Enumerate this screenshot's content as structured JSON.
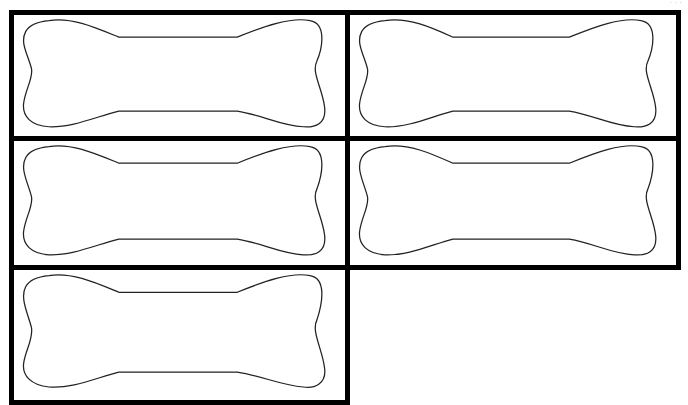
{
  "page": {
    "header_text": "· · ·",
    "cells": [
      {
        "id": 1,
        "shape": "bone-outline",
        "label": ""
      },
      {
        "id": 2,
        "shape": "bone-outline",
        "label": ""
      },
      {
        "id": 3,
        "shape": "bone-outline",
        "label": ""
      },
      {
        "id": 4,
        "shape": "bone-outline",
        "label": ""
      },
      {
        "id": 5,
        "shape": "bone-outline",
        "label": ""
      }
    ],
    "colors": {
      "border": "#000000",
      "outline": "#222222",
      "background": "#ffffff"
    }
  }
}
